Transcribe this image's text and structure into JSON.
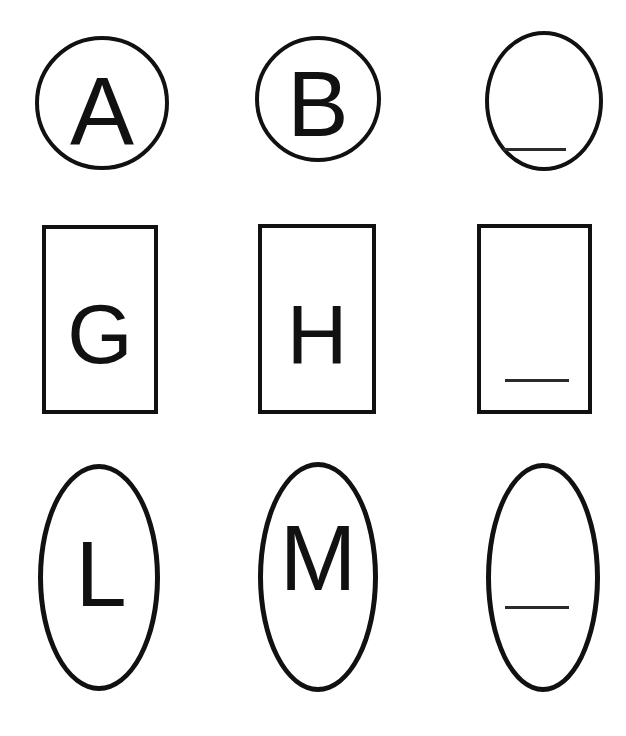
{
  "worksheet": {
    "title": "Shapes and Letters Matching Worksheet",
    "background_color": "#ffffff",
    "stroke_color": "#111111",
    "line_color": "#2b2b2b",
    "grid": {
      "rows": 3,
      "columns": 3
    }
  },
  "rows": [
    {
      "shape": "circle",
      "shape_label": "Circle",
      "cells": [
        {
          "letter": "A",
          "filled": true
        },
        {
          "letter": "B",
          "filled": true
        },
        {
          "letter": "",
          "filled": false,
          "blank_label": "answer-line"
        }
      ]
    },
    {
      "shape": "rectangle",
      "shape_label": "Rectangle",
      "cells": [
        {
          "letter": "G",
          "filled": true
        },
        {
          "letter": "H",
          "filled": true
        },
        {
          "letter": "",
          "filled": false,
          "blank_label": "answer-line"
        }
      ]
    },
    {
      "shape": "oval",
      "shape_label": "Oval",
      "cells": [
        {
          "letter": "L",
          "filled": true
        },
        {
          "letter": "M",
          "filled": true
        },
        {
          "letter": "",
          "filled": false,
          "blank_label": "answer-line"
        }
      ]
    }
  ]
}
